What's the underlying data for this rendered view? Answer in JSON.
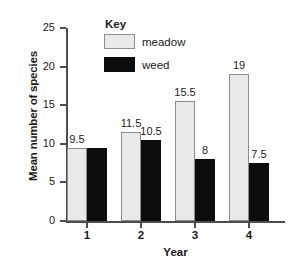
{
  "chart_data": {
    "type": "bar",
    "title": "",
    "xlabel": "Year",
    "ylabel": "Mean number of species",
    "categories": [
      "1",
      "2",
      "3",
      "4"
    ],
    "series": [
      {
        "name": "meadow",
        "color": "#e9e9e9",
        "values": [
          9.5,
          11.5,
          15.5,
          19
        ]
      },
      {
        "name": "weed",
        "color": "#0d0d0d",
        "values": [
          9.5,
          10.5,
          8,
          7.5
        ]
      }
    ],
    "value_labels": {
      "meadow": [
        "9.5",
        "11.5",
        "15.5",
        "19"
      ],
      "weed": [
        "",
        "10.5",
        "8",
        "7.5"
      ]
    },
    "ylim": [
      0,
      25
    ],
    "yticks": [
      0,
      5,
      10,
      15,
      20,
      25
    ],
    "ytick_labels": [
      "0",
      "5",
      "10",
      "15",
      "20",
      "25"
    ],
    "grid": false,
    "legend": {
      "title": "Key",
      "position": "top-center",
      "entries": [
        {
          "label": "meadow",
          "swatch": "meadow"
        },
        {
          "label": "weed",
          "swatch": "weed"
        }
      ]
    }
  }
}
